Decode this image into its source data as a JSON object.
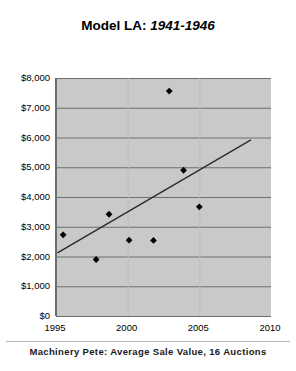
{
  "title": {
    "main": "Model LA:",
    "sub": "1941-1946"
  },
  "caption": "Machinery Pete: Average Sale Value, 16 Auctions",
  "axes": {
    "y_ticks": [
      "$8,000",
      "$7,000",
      "$6,000",
      "$5,000",
      "$4,000",
      "$3,000",
      "$2,000",
      "$1,000",
      "$0"
    ],
    "x_ticks": [
      "1995",
      "2000",
      "2005",
      "2010"
    ]
  },
  "colors": {
    "plot_background": "#c9c9c9",
    "gridline": "#6e6e6e",
    "marker": "#000000",
    "trendline": "#2b2b2b",
    "page_background": "#ffffff",
    "text": "#000000"
  },
  "chart_data": {
    "type": "scatter",
    "title": "Model LA: 1941-1946",
    "subtitle": "Machinery Pete: Average Sale Value, 16 Auctions",
    "xlabel": "",
    "ylabel": "",
    "xlim": [
      1995,
      2010
    ],
    "ylim": [
      0,
      8000
    ],
    "xticks": [
      1995,
      2000,
      2005,
      2010
    ],
    "yticks": [
      0,
      1000,
      2000,
      3000,
      4000,
      5000,
      6000,
      7000,
      8000
    ],
    "grid": true,
    "legend": "none",
    "series": [
      {
        "name": "Average Sale Value",
        "marker": "diamond",
        "x": [
          1995.5,
          1997.8,
          1998.7,
          2000.1,
          2001.8,
          2002.9,
          2003.9,
          2005.0
        ],
        "y": [
          2730,
          1900,
          3420,
          2550,
          2540,
          7560,
          4900,
          3670
        ]
      },
      {
        "name": "Linear trend",
        "type": "line",
        "x": [
          1995.1,
          2008.6
        ],
        "y": [
          2120,
          5920
        ]
      }
    ],
    "annotations": []
  }
}
